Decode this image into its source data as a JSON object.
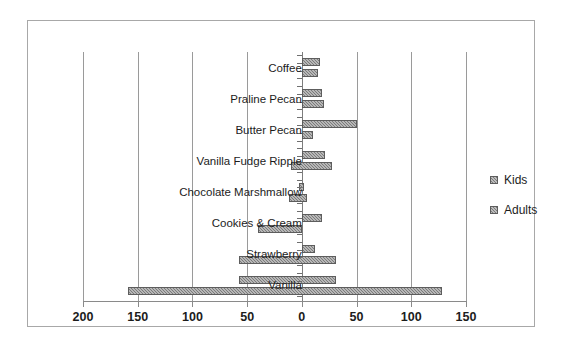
{
  "chart_data": {
    "type": "bar",
    "orientation": "horizontal",
    "title": "",
    "subtitle": "",
    "xlabel": "",
    "ylabel": "",
    "grid": true,
    "legend_position": "right",
    "axis_note": "Diverging / tornado bar chart: values extend left (negative direction) and right (positive direction) from a center 0 axis.",
    "xlim": [
      -200,
      150
    ],
    "xticks": [
      -200,
      -150,
      -100,
      -50,
      0,
      50,
      100,
      150
    ],
    "xticklabels": [
      "200",
      "150",
      "100",
      "50",
      "0",
      "50",
      "100",
      "150"
    ],
    "categories": [
      "Coffee",
      "Praline Pecan",
      "Butter Pecan",
      "Vanilla Fudge Ripple",
      "Chocolate Marshmallow",
      "Cookies & Cream",
      "Strawberry",
      "Vanilla"
    ],
    "series": [
      {
        "name": "Kids",
        "left_values": [
          0,
          0,
          0,
          0,
          -3,
          0,
          0,
          -57
        ],
        "right_values": [
          17,
          18,
          50,
          21,
          2,
          18,
          12,
          31
        ]
      },
      {
        "name": "Adults",
        "left_values": [
          0,
          0,
          0,
          -10,
          -12,
          -40,
          -57,
          -159
        ],
        "right_values": [
          15,
          20,
          10,
          28,
          5,
          0,
          31,
          128
        ]
      }
    ]
  },
  "axis": {
    "ticks": [
      {
        "label": "200",
        "value": -200
      },
      {
        "label": "150",
        "value": -150
      },
      {
        "label": "100",
        "value": -100
      },
      {
        "label": "50",
        "value": -50
      },
      {
        "label": "0",
        "value": 0
      },
      {
        "label": "50",
        "value": 50
      },
      {
        "label": "100",
        "value": 100
      },
      {
        "label": "150",
        "value": 150
      }
    ]
  },
  "legend": {
    "items": [
      {
        "label": "Kids"
      },
      {
        "label": "Adults"
      }
    ]
  },
  "colors": {
    "bar_fill": "#7b7b7b",
    "bar_border": "#5d5d5d",
    "gridline": "#9a9a9a",
    "axis": "#8a8a8a",
    "frame": "#a8a8a8",
    "text": "#1c1c1c",
    "background": "#ffffff"
  },
  "rows": [
    {
      "label": "Coffee"
    },
    {
      "label": "Praline Pecan"
    },
    {
      "label": "Butter Pecan"
    },
    {
      "label": "Vanilla Fudge Ripple"
    },
    {
      "label": "Chocolate Marshmallow"
    },
    {
      "label": "Cookies & Cream"
    },
    {
      "label": "Strawberry"
    },
    {
      "label": "Vanilla"
    }
  ]
}
